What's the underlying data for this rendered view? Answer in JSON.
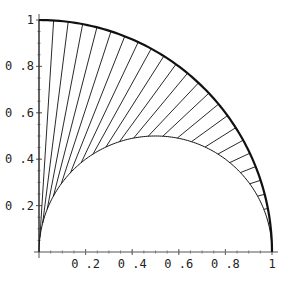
{
  "chart_data": {
    "type": "line",
    "title": "",
    "xlabel": "",
    "ylabel": "",
    "xlim": [
      0,
      1
    ],
    "ylim": [
      0,
      1
    ],
    "xticks": [
      "0.2",
      "0.4",
      "0.6",
      "0.8",
      "1"
    ],
    "yticks": [
      "0.2",
      "0.4",
      "0.6",
      "0.8",
      "1"
    ],
    "grid": false,
    "series": [
      {
        "name": "outer quarter circle",
        "description": "x^2 + y^2 = 1, 0<=x<=1"
      },
      {
        "name": "inner semicircle",
        "description": "(x-0.5)^2 + y^2 = 0.25"
      },
      {
        "name": "radial segments",
        "count": 26,
        "description": "segments from origin-rays between inner and outer arcs, angles 0..90 deg"
      }
    ]
  }
}
